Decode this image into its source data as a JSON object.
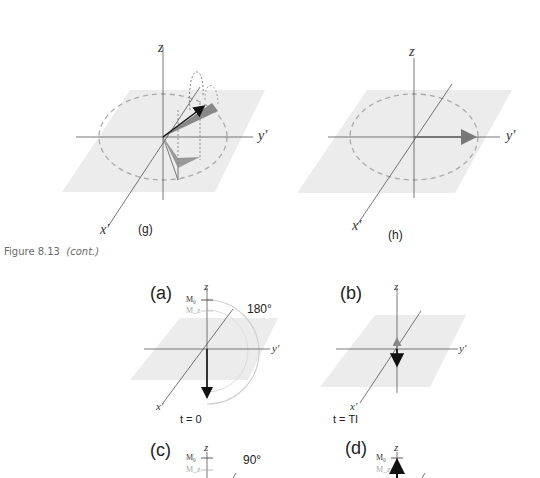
{
  "figure": {
    "caption_prefix": "Figure 8.13",
    "caption_suffix": "(cont.)"
  },
  "panels_top": [
    {
      "id": "g",
      "label": "(g)",
      "axes": {
        "z": "z",
        "y": "y′",
        "x": "x′"
      }
    },
    {
      "id": "h",
      "label": "(h)",
      "axes": {
        "z": "z",
        "y": "y′",
        "x": "x′"
      }
    }
  ],
  "panels_bottom": [
    {
      "id": "a",
      "label": "(a)",
      "axes": {
        "z": "z",
        "y": "y′",
        "x": "x′"
      },
      "angle": "180°",
      "time": "t = 0",
      "m0": "M₀",
      "mz": "M_z"
    },
    {
      "id": "b",
      "label": "(b)",
      "axes": {
        "z": "z",
        "y": "y′",
        "x": "x′"
      },
      "time": "t = TI"
    },
    {
      "id": "c",
      "label": "(c)",
      "axes": {
        "z": "z"
      },
      "angle": "90°",
      "m0": "M₀",
      "mz": "M_z"
    },
    {
      "id": "d",
      "label": "(d)",
      "axes": {
        "z": "z"
      },
      "m0": "M₀",
      "mz": "M_z"
    }
  ],
  "colors": {
    "plane": "#ececec",
    "axis": "#555555",
    "dashed_circle": "#aaaaaa",
    "arrow_dark": "#111111",
    "arrow_gray": "#888888"
  }
}
